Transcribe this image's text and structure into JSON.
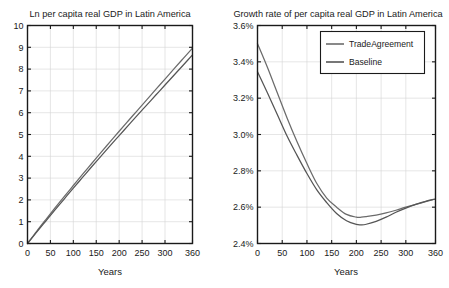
{
  "chart_data": [
    {
      "id": "left",
      "type": "line",
      "title": "Ln per capita real GDP in Latin America",
      "xlabel": "Years",
      "ylabel": "",
      "xlim": [
        0,
        360
      ],
      "ylim": [
        0,
        10
      ],
      "xticks": [
        0,
        50,
        100,
        150,
        200,
        250,
        300,
        360
      ],
      "xticklabels": [
        "0",
        "50",
        "100",
        "150",
        "200",
        "250",
        "300",
        "360"
      ],
      "yticks": [
        0,
        1,
        2,
        3,
        4,
        5,
        6,
        7,
        8,
        9,
        10
      ],
      "yticklabels": [
        "0",
        "1",
        "2",
        "3",
        "4",
        "5",
        "6",
        "7",
        "8",
        "9",
        "10"
      ],
      "grid": true,
      "legend": "none",
      "x": [
        0,
        20,
        40,
        60,
        80,
        100,
        120,
        140,
        160,
        180,
        200,
        220,
        240,
        260,
        280,
        300,
        320,
        340,
        360
      ],
      "series": [
        {
          "name": "TradeAgreement",
          "color": "#6b6b6b",
          "values": [
            0.0,
            0.56,
            1.1,
            1.63,
            2.15,
            2.66,
            3.17,
            3.67,
            4.17,
            4.66,
            5.15,
            5.63,
            6.11,
            6.59,
            7.07,
            7.54,
            8.02,
            8.49,
            8.96
          ]
        },
        {
          "name": "Baseline",
          "color": "#555555",
          "values": [
            0.0,
            0.52,
            1.03,
            1.54,
            2.04,
            2.54,
            3.03,
            3.52,
            4.0,
            4.48,
            4.95,
            5.42,
            5.89,
            6.35,
            6.81,
            7.27,
            7.73,
            8.19,
            8.65
          ]
        }
      ]
    },
    {
      "id": "right",
      "type": "line",
      "title": "Growth rate of per capita real GDP in Latin America",
      "xlabel": "Years",
      "ylabel": "",
      "xlim": [
        0,
        360
      ],
      "ylim": [
        2.4,
        3.6
      ],
      "xticks": [
        0,
        50,
        100,
        150,
        200,
        250,
        300,
        360
      ],
      "xticklabels": [
        "0",
        "50",
        "100",
        "150",
        "200",
        "250",
        "300",
        "360"
      ],
      "yticks": [
        2.4,
        2.6,
        2.8,
        3.0,
        3.2,
        3.4,
        3.6
      ],
      "yticklabels": [
        "2.4%",
        "2.6%",
        "2.8%",
        "3.0%",
        "3.2%",
        "3.4%",
        "3.6%"
      ],
      "grid": true,
      "legend": "upper-right",
      "x": [
        0,
        20,
        40,
        60,
        80,
        100,
        120,
        140,
        160,
        180,
        200,
        210,
        220,
        240,
        260,
        280,
        300,
        320,
        340,
        360
      ],
      "series": [
        {
          "name": "TradeAgreement",
          "color": "#6b6b6b",
          "values": [
            3.5,
            3.37,
            3.23,
            3.09,
            2.96,
            2.84,
            2.73,
            2.65,
            2.6,
            2.56,
            2.545,
            2.545,
            2.548,
            2.556,
            2.568,
            2.583,
            2.6,
            2.615,
            2.63,
            2.645
          ]
        },
        {
          "name": "Baseline",
          "color": "#555555",
          "values": [
            3.345,
            3.23,
            3.11,
            2.99,
            2.885,
            2.785,
            2.695,
            2.625,
            2.565,
            2.525,
            2.505,
            2.503,
            2.506,
            2.522,
            2.545,
            2.572,
            2.595,
            2.615,
            2.632,
            2.645
          ]
        }
      ]
    }
  ],
  "legend": {
    "entries": [
      {
        "label": "TradeAgreement",
        "color": "#6b6b6b"
      },
      {
        "label": "Baseline",
        "color": "#555555"
      }
    ]
  }
}
